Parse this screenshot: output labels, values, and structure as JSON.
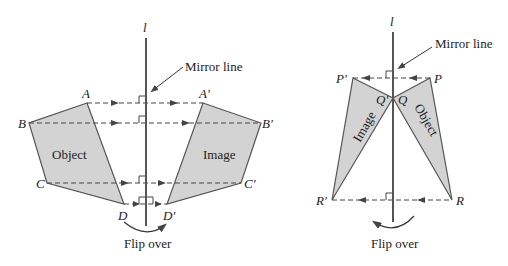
{
  "left_diagram": {
    "mirror_label": "l",
    "mirror_caption": "Mirror line",
    "object_label": "Object",
    "image_label": "Image",
    "flip_caption": "Flip over",
    "points": {
      "A": "A",
      "B": "B",
      "C": "C",
      "D": "D",
      "A_prime": "A′",
      "B_prime": "B′",
      "C_prime": "C′",
      "D_prime": "D′"
    }
  },
  "right_diagram": {
    "mirror_label": "l",
    "mirror_caption": "Mirror line",
    "object_label": "Object",
    "image_label": "Image",
    "flip_caption": "Flip over",
    "points": {
      "P": "P",
      "Q": "Q",
      "R": "R",
      "P_prime": "P′",
      "Q_prime": "Q′",
      "R_prime": "R′"
    }
  },
  "colors": {
    "fill": "#d3d3d3",
    "stroke": "#555555",
    "text": "#222222"
  }
}
